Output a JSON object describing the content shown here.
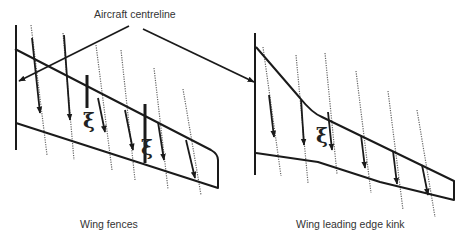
{
  "labels": {
    "top": "Aircraft centreline",
    "left_caption": "Wing fences",
    "right_caption": "Wing leading edge kink"
  },
  "symbols": {
    "vortex": "ξ"
  },
  "colors": {
    "line": "#1a1a1a",
    "streamline": "#555555",
    "text": "#333333",
    "background": "#ffffff"
  },
  "panels": [
    {
      "name": "wing-fences",
      "caption": "Wing fences",
      "features": [
        "aircraft centreline",
        "swept wing planform",
        "two wing fences",
        "spanwise flow streamlines",
        "vortex symbols"
      ]
    },
    {
      "name": "wing-leading-edge-kink",
      "caption": "Wing leading edge kink",
      "features": [
        "aircraft centreline",
        "kinked leading edge planform",
        "spanwise flow streamlines",
        "vortex symbol at kink"
      ]
    }
  ]
}
